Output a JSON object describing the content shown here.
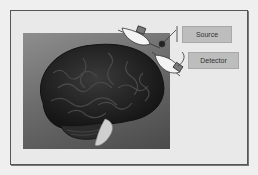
{
  "figure": {
    "labels": {
      "source": "Source",
      "detector": "Detector"
    },
    "illustration": "brain-with-optode-probes",
    "colors": {
      "frame_background": "#e9e9e9",
      "frame_border": "#555555",
      "label_box": "#bdbdbd",
      "brain": "#2a2a2a",
      "photo_background": "#6c6c6c"
    }
  }
}
